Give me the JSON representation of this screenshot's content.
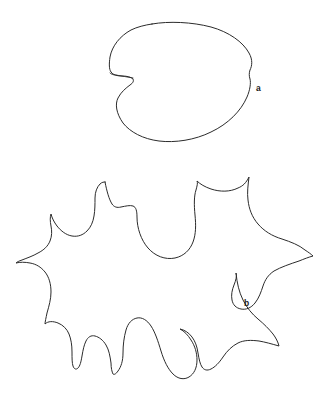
{
  "figure": {
    "type": "line-drawing",
    "background_color": "#ffffff",
    "stroke_color": "#2b2b2b",
    "label_color": "#1a1a1a",
    "canvas": {
      "width": 331,
      "height": 398
    },
    "panels": [
      {
        "id": "panel-a",
        "label": "a",
        "label_position": {
          "x": 256,
          "y": 91
        },
        "description": "entire cordate leaf outline",
        "bounds": {
          "x": 108,
          "y": 22,
          "width": 145,
          "height": 120
        }
      },
      {
        "id": "panel-b",
        "label": "b",
        "label_position": {
          "x": 244,
          "y": 306
        },
        "description": "deeply lobed palmate leaf outline",
        "bounds": {
          "x": 12,
          "y": 174,
          "width": 302,
          "height": 205
        }
      }
    ]
  },
  "shape_a": {
    "name": "cordate-leaf-outline",
    "path": "M 152 24 C 169 21 192 22 211 27 C 229 32 243 42 249 53 C 253 60 252 66 250 70 C 249 73 249 76 250 79 C 251 83 250 90 247 97 C 241 111 228 124 211 132 C 195 140 175 143 159 141 C 143 139 130 132 123 123 C 116 113 115 104 118 98 C 121 92 126 88 130 85 C 133 83 134 81 133 79 C 131 77 127 76 122 76 C 117 76 113 75 111 72 C 109 69 109 64 110 57 C 112 46 120 36 131 30 C 137 27 145 25 152 24 Z",
    "petiole_path": "M 133 78 C 128 77 121 76 116 75 C 113 75 111 74 110 73"
  },
  "shape_b": {
    "name": "lobed-palmate-leaf-outline",
    "path": "M 105 182 C 107 192 109 199 112 204 C 114 207 117 208 121 207 C 126 206 130 205 133 206 C 136 207 137 211 137 217 C 137 228 141 240 148 248 C 155 256 165 260 175 258 C 184 256 190 250 193 242 C 196 234 196 225 195 215 C 194 205 194 196 196 190 C 197 186 198 183 197 181 C 200 184 205 187 211 189 C 220 192 230 192 238 188 C 243 186 246 183 249 177 C 248 185 247 193 248 200 C 249 209 252 217 258 224 C 264 231 272 236 282 239 C 291 242 299 245 305 250 C 308 252 311 254 313 256 C 309 257 304 259 299 261 C 290 264 281 267 274 271 C 268 275 265 280 263 286 C 261 292 259 298 255 303 C 251 308 246 310 241 309 C 236 308 233 305 232 300 C 231 295 232 290 234 285 C 236 280 237 276 236 273 C 237 283 239 292 243 300 C 247 308 252 314 258 319 C 264 324 269 329 273 334 C 276 338 278 342 279 346 C 272 344 265 342 259 341 C 251 340 244 340 238 343 C 232 346 227 351 223 357 C 219 363 215 367 211 369 C 207 371 204 370 202 367 C 200 364 199 359 198 353 C 197 346 195 341 192 337 C 189 333 185 330 180 329 C 184 331 188 335 191 340 C 195 346 197 353 197 360 C 197 368 194 374 189 377 C 184 380 178 379 173 374 C 168 369 164 361 161 351 C 158 341 155 332 151 326 C 147 320 142 317 137 318 C 132 319 128 323 126 330 C 124 337 123 345 123 353 C 123 361 121 367 118 371 C 116 374 114 375 113 374 C 112 372 111 368 111 363 C 110 356 109 350 106 345 C 103 340 99 337 95 336 C 91 335 88 337 86 341 C 84 345 83 350 82 356 C 81 362 80 366 78 368 C 76 370 74 369 73 366 C 72 363 72 358 72 352 C 72 345 71 339 69 334 C 67 329 63 325 58 323 C 53 321 48 321 45 324 C 45 322 46 318 47 313 C 49 306 51 299 51 292 C 51 284 49 277 45 272 C 41 267 36 264 30 263 C 25 262 20 262 16 263 C 17 262 19 261 22 260 C 27 258 33 256 38 253 C 44 250 48 246 50 241 C 52 236 52 231 51 226 C 50 221 50 217 51 214 C 52 218 54 222 57 226 C 61 231 66 235 72 236 C 78 237 83 235 87 231 C 91 227 93 222 94 216 C 95 210 95 204 95 198 C 95 192 97 187 100 184 C 102 182 104 182 105 182 Z"
  },
  "labels": [
    {
      "id": "label-a",
      "text": "a",
      "x": 256,
      "y": 91
    },
    {
      "id": "label-b",
      "text": "b",
      "x": 244,
      "y": 306
    }
  ]
}
